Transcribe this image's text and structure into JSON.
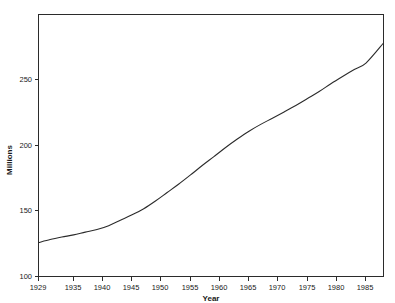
{
  "figure": {
    "top_clipped_text": "",
    "background_color": "#ffffff",
    "line_color": "#2b2b2b",
    "axis_color": "#2b2b2b"
  },
  "chart_data": {
    "type": "line",
    "title": "",
    "xlabel": "Year",
    "ylabel": "Millions",
    "grid": false,
    "legend": "none",
    "xlim": [
      1929,
      1988
    ],
    "ylim": [
      100,
      270
    ],
    "xticks": [
      1929,
      1935,
      1940,
      1945,
      1950,
      1955,
      1960,
      1965,
      1970,
      1975,
      1980,
      1985
    ],
    "xtick_labels": [
      "1929",
      "1935",
      "1940",
      "1945",
      "1950",
      "1955",
      "1960",
      "1965",
      "1970",
      "1975",
      "1980",
      "1985"
    ],
    "yticks": [
      100,
      150,
      200,
      250
    ],
    "ytick_labels": [
      "100",
      "150",
      "200",
      "250"
    ],
    "series": [
      {
        "name": "Population",
        "x": [
          1929,
          1931,
          1933,
          1935,
          1937,
          1939,
          1941,
          1943,
          1945,
          1947,
          1949,
          1951,
          1953,
          1955,
          1957,
          1959,
          1961,
          1963,
          1965,
          1967,
          1969,
          1971,
          1973,
          1975,
          1977,
          1979,
          1981,
          1983,
          1985,
          1988
        ],
        "values": [
          122.0,
          124.0,
          125.6,
          127.0,
          128.8,
          130.5,
          133.0,
          136.5,
          140.0,
          144.0,
          149.0,
          154.5,
          160.0,
          165.9,
          172.0,
          177.8,
          183.7,
          189.2,
          194.3,
          198.7,
          202.7,
          206.8,
          211.0,
          215.5,
          220.0,
          225.1,
          229.8,
          234.3,
          238.5,
          251.5
        ]
      }
    ],
    "ytick_unit": "Millions"
  },
  "axes": {
    "x_axis_title": "Year",
    "y_axis_title": "Millions"
  }
}
